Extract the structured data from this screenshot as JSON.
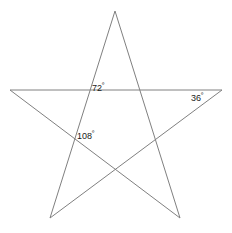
{
  "figure": {
    "background_color": "#ffffff",
    "stroke_color": "#808080",
    "stroke_width": 1,
    "text_color": "#1a1a1a",
    "width": 232,
    "height": 233
  },
  "labels": [
    {
      "id": "angle-72",
      "value": "72",
      "degree_symbol": "º",
      "text": "72º",
      "x": 92,
      "y": 82
    },
    {
      "id": "angle-36",
      "value": "36",
      "degree_symbol": "º",
      "text": "36º",
      "x": 191,
      "y": 92
    },
    {
      "id": "angle-108",
      "value": "108",
      "degree_symbol": "º",
      "text": "108º",
      "x": 77,
      "y": 130
    }
  ],
  "chart_data": {
    "type": "diagram",
    "shape": "pentagram",
    "title": "",
    "points": [
      {
        "name": "apex-top",
        "x": 115,
        "y": 11
      },
      {
        "name": "left-outer",
        "x": 10,
        "y": 90
      },
      {
        "name": "right-outer",
        "x": 222,
        "y": 90
      },
      {
        "name": "bottom-left",
        "x": 50,
        "y": 218
      },
      {
        "name": "bottom-right",
        "x": 180,
        "y": 218
      }
    ],
    "edges": [
      {
        "from": "apex-top",
        "to": "bottom-left"
      },
      {
        "from": "bottom-left",
        "to": "right-outer"
      },
      {
        "from": "right-outer",
        "to": "left-outer"
      },
      {
        "from": "left-outer",
        "to": "bottom-right"
      },
      {
        "from": "bottom-right",
        "to": "apex-top"
      }
    ],
    "intersections": [
      {
        "name": "upper-left-node",
        "x": 90,
        "y": 90
      },
      {
        "name": "upper-right-node",
        "x": 145,
        "y": 90
      },
      {
        "name": "left-node",
        "x": 77,
        "y": 135
      },
      {
        "name": "right-node",
        "x": 152,
        "y": 138
      },
      {
        "name": "bottom-node",
        "x": 115,
        "y": 172
      }
    ],
    "angle_labels": [
      {
        "label": "72º",
        "value": 72,
        "at": "upper-left-node"
      },
      {
        "label": "36º",
        "value": 36,
        "at": "right-outer"
      },
      {
        "label": "108º",
        "value": 108,
        "at": "left-node"
      }
    ],
    "axis": {
      "visible": false
    },
    "grid": false,
    "legend": null
  }
}
